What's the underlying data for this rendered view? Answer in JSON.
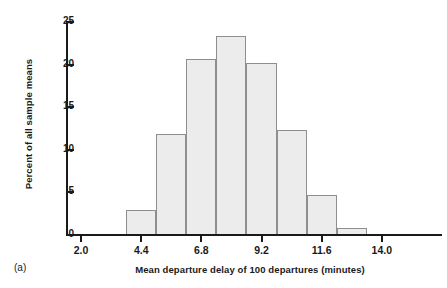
{
  "figure": {
    "panel_label": "(a)"
  },
  "chart_data": {
    "type": "bar",
    "title": "",
    "subtitle": "",
    "xlabel": "Mean departure delay of 100 departures (minutes)",
    "ylabel": "Percent of all sample means",
    "xlim": [
      1.4,
      16.4
    ],
    "ylim": [
      0,
      25
    ],
    "xtick_labels": [
      "2.0",
      "4.4",
      "6.8",
      "9.2",
      "11.6",
      "14.0"
    ],
    "xtick_values": [
      2.0,
      4.4,
      6.8,
      9.2,
      11.6,
      14.0
    ],
    "ytick_labels": [
      "0",
      "5",
      "10",
      "15",
      "20",
      "25"
    ],
    "ytick_values": [
      0,
      5,
      10,
      15,
      20,
      25
    ],
    "grid": false,
    "legend": "none",
    "bin_width": 1.2,
    "bin_edges": [
      2.6,
      3.8,
      5.0,
      6.2,
      7.4,
      8.6,
      9.8,
      11.0,
      12.2,
      13.4,
      14.6
    ],
    "categories": [
      "2.6-3.8",
      "3.8-5.0",
      "5.0-6.2",
      "6.2-7.4",
      "7.4-8.6",
      "8.6-9.8",
      "9.8-11.0",
      "11.0-12.2",
      "12.2-13.4",
      "13.4-14.6"
    ],
    "values": [
      0.1,
      2.9,
      11.8,
      20.7,
      23.3,
      20.2,
      12.3,
      4.7,
      0.8,
      0.15
    ],
    "bar_fill_color": "#ececed",
    "bar_edge_color": "#8e8e90",
    "axis_color": "#1a1a1a"
  }
}
